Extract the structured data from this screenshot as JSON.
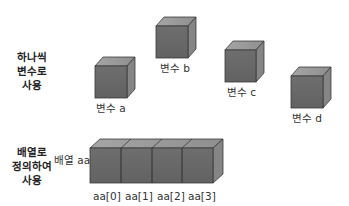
{
  "colors": {
    "front": "#6a6a6a",
    "top": "#9a9a9a",
    "side": "#8a8a8a",
    "edge": "#3a3a3a",
    "text": "#333333"
  },
  "individual": {
    "group_label": [
      "하나씩",
      "변수로",
      "사용"
    ],
    "variables": [
      {
        "name": "변수 a",
        "x": 95,
        "y": 66,
        "label_x": 96,
        "label_y": 101
      },
      {
        "name": "변수 b",
        "x": 156,
        "y": 26,
        "label_x": 161,
        "label_y": 62
      },
      {
        "name": "변수 c",
        "x": 225,
        "y": 50,
        "label_x": 227,
        "label_y": 86
      },
      {
        "name": "변수 d",
        "x": 291,
        "y": 76,
        "label_x": 292,
        "label_y": 112
      }
    ]
  },
  "array": {
    "group_label": [
      "배열로",
      "정의하여",
      "사용"
    ],
    "name": "배열 aa",
    "elements": [
      "aa[0]",
      "aa[1]",
      "aa[2]",
      "aa[3]"
    ]
  }
}
